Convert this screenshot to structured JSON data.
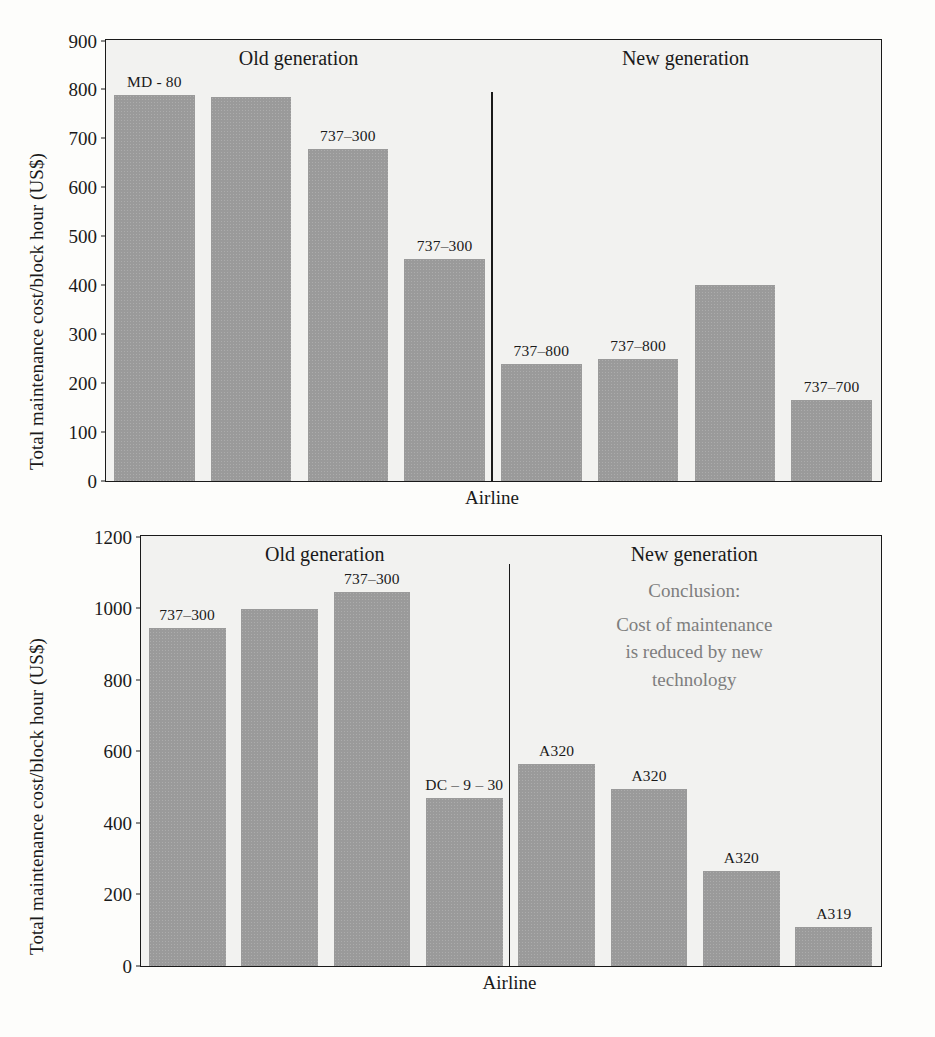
{
  "chart_data": [
    {
      "type": "bar",
      "title": "",
      "xlabel": "Airline",
      "ylabel": "Total maintenance cost/block hour (US$)",
      "ylim": [
        0,
        900
      ],
      "ytick_labels": [
        "900",
        "800",
        "700",
        "600",
        "500",
        "400",
        "300",
        "200",
        "100",
        "0"
      ],
      "ytick_values": [
        900,
        800,
        700,
        600,
        500,
        400,
        300,
        200,
        100,
        0
      ],
      "grid": false,
      "legend": "none",
      "groups": [
        {
          "name": "Old generation",
          "label": "Old generation"
        },
        {
          "name": "New generation",
          "label": "New generation"
        }
      ],
      "categories": [
        "MD - 80",
        "",
        "737–300",
        "737–300",
        "737–800",
        "737–800",
        "",
        "737–700"
      ],
      "bar_labels": [
        "MD - 80",
        "",
        "737–300",
        "737–300",
        "737–800",
        "737–800",
        "",
        "737–700"
      ],
      "values": [
        790,
        785,
        680,
        455,
        240,
        250,
        400,
        165
      ],
      "bars": [
        {
          "label": "MD - 80",
          "value": 790,
          "group": "Old generation"
        },
        {
          "label": "",
          "value": 785,
          "group": "Old generation"
        },
        {
          "label": "737–300",
          "value": 680,
          "group": "Old generation"
        },
        {
          "label": "737–300",
          "value": 455,
          "group": "Old generation"
        },
        {
          "label": "737–800",
          "value": 240,
          "group": "New generation"
        },
        {
          "label": "737–800",
          "value": 250,
          "group": "New generation"
        },
        {
          "label": "",
          "value": 400,
          "group": "New generation"
        },
        {
          "label": "737–700",
          "value": 165,
          "group": "New generation"
        }
      ]
    },
    {
      "type": "bar",
      "title": "",
      "xlabel": "Airline",
      "ylabel": "Total maintenance cost/block hour (US$)",
      "ylim": [
        0,
        1200
      ],
      "ytick_labels": [
        "1200",
        "1000",
        "800",
        "600",
        "400",
        "200",
        "0"
      ],
      "ytick_values": [
        1200,
        1000,
        800,
        600,
        400,
        200,
        0
      ],
      "grid": false,
      "legend": "none",
      "groups": [
        {
          "name": "Old generation",
          "label": "Old generation"
        },
        {
          "name": "New generation",
          "label": "New generation"
        }
      ],
      "annotation": {
        "lines": [
          "Conclusion:",
          "Cost of maintenance",
          "is reduced by new",
          "technology"
        ],
        "color": "#7e7e7e"
      },
      "categories": [
        "737–300",
        "",
        "737–300",
        "DC – 9 – 30",
        "A320",
        "A320",
        "A320",
        "A319"
      ],
      "bar_labels": [
        "737–300",
        "",
        "737–300",
        "DC – 9 – 30",
        "A320",
        "A320",
        "A320",
        "A319"
      ],
      "values": [
        945,
        1000,
        1045,
        470,
        565,
        495,
        265,
        110
      ],
      "bars": [
        {
          "label": "737–300",
          "value": 945,
          "group": "Old generation"
        },
        {
          "label": "",
          "value": 1000,
          "group": "Old generation"
        },
        {
          "label": "737–300",
          "value": 1045,
          "group": "Old generation"
        },
        {
          "label": "DC – 9 – 30",
          "value": 470,
          "group": "Old generation"
        },
        {
          "label": "A320",
          "value": 565,
          "group": "New generation"
        },
        {
          "label": "A320",
          "value": 495,
          "group": "New generation"
        },
        {
          "label": "A320",
          "value": 265,
          "group": "New generation"
        },
        {
          "label": "A319",
          "value": 110,
          "group": "New generation"
        }
      ]
    }
  ],
  "colors": {
    "bar_fill": "#9a9a9a",
    "plot_background": "#f2f2f0",
    "axis": "#1a1a1a",
    "annotation_text": "#7e7e7e"
  }
}
